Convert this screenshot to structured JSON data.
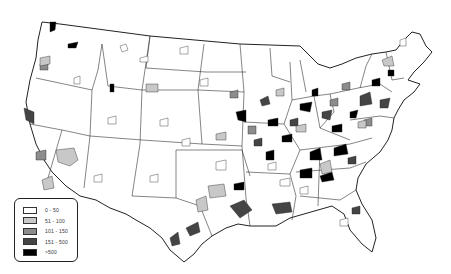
{
  "map": {
    "subject": "Contiguous United States county map (choropleth)",
    "colors": {
      "outline": "#222222",
      "background": "#ffffff"
    }
  },
  "legend": {
    "items": [
      {
        "label": "0 - 50",
        "color": "#ffffff"
      },
      {
        "label": "51 - 100",
        "color": "#c8c8c8"
      },
      {
        "label": "101 - 150",
        "color": "#8c8c8c"
      },
      {
        "label": "151 - 500",
        "color": "#444444"
      },
      {
        "label": ">500",
        "color": "#000000"
      }
    ]
  }
}
